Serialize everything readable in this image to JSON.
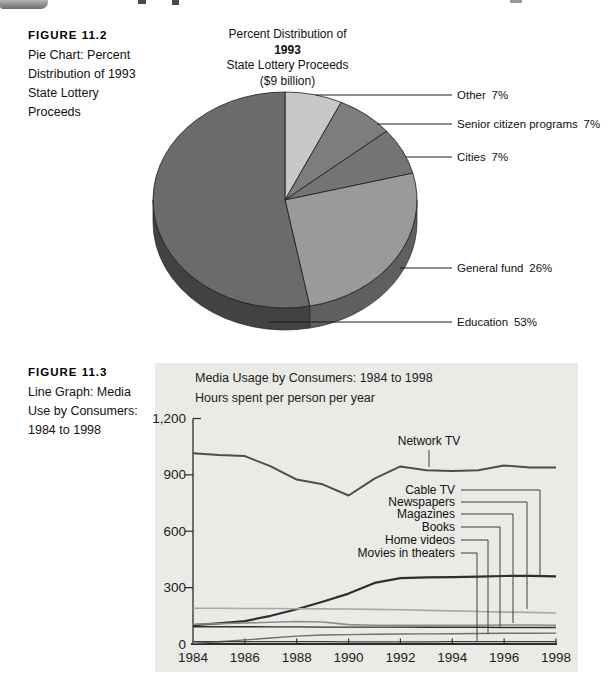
{
  "page": {
    "figure2": {
      "heading": "FIGURE 11.2",
      "caption_lines": [
        "Pie Chart: Percent",
        "Distribution of 1993",
        "State Lottery Proceeds"
      ]
    },
    "figure3": {
      "heading": "FIGURE 11.3",
      "caption_lines": [
        "Line Graph: Media",
        "Use by Consumers:",
        "1984 to 1998"
      ]
    }
  },
  "chart_data": [
    {
      "type": "pie",
      "title_lines": [
        "Percent Distribution of",
        "1993",
        "State Lottery Proceeds",
        "($9 billion)"
      ],
      "start_at": "12 o'clock",
      "direction": "clockwise",
      "style": "3d",
      "outline_color": "#1a1a1a",
      "slices": [
        {
          "label": "Other",
          "pct": 7,
          "color": "#c8c8c8"
        },
        {
          "label": "Senior citizen programs",
          "pct": 7,
          "color": "#7d7d7d"
        },
        {
          "label": "Cities",
          "pct": 7,
          "color": "#747474"
        },
        {
          "label": "General fund",
          "pct": 26,
          "color": "#9a9a9a"
        },
        {
          "label": "Education",
          "pct": 53,
          "color": "#6b6b6b"
        }
      ]
    },
    {
      "type": "line",
      "title": "Media Usage by Consumers: 1984 to 1998",
      "ylabel": "Hours spent per person per year",
      "xlabel": "",
      "ylim": [
        0,
        1200
      ],
      "grid": false,
      "legend_position": "inline-labels",
      "panel_color": "#eaeae7",
      "x": [
        1984,
        1985,
        1986,
        1987,
        1988,
        1989,
        1990,
        1991,
        1992,
        1993,
        1994,
        1995,
        1996,
        1997,
        1998
      ],
      "xticks": [
        1984,
        1986,
        1988,
        1990,
        1992,
        1994,
        1996,
        1998
      ],
      "ytick_values": [
        1200,
        900,
        600,
        300,
        0
      ],
      "ytick_labels": [
        "1,200",
        "900",
        "600",
        "300",
        "0"
      ],
      "series": [
        {
          "name": "Network TV",
          "color": "#4d4d4d",
          "width": 2.0,
          "values": [
            1015,
            1005,
            1000,
            945,
            875,
            850,
            790,
            880,
            945,
            925,
            920,
            925,
            950,
            940,
            940
          ]
        },
        {
          "name": "Cable TV",
          "color": "#2e2e2e",
          "width": 2.2,
          "values": [
            100,
            110,
            122,
            150,
            185,
            225,
            268,
            325,
            350,
            355,
            356,
            358,
            362,
            363,
            360
          ]
        },
        {
          "name": "Newspapers",
          "color": "#a9a9a9",
          "width": 1.6,
          "values": [
            190,
            190,
            189,
            189,
            188,
            187,
            186,
            184,
            182,
            179,
            176,
            173,
            170,
            168,
            165
          ]
        },
        {
          "name": "Magazines",
          "color": "#8d8d8d",
          "width": 1.6,
          "values": [
            105,
            108,
            112,
            116,
            120,
            117,
            103,
            100,
            99,
            99,
            100,
            100,
            101,
            101,
            100
          ]
        },
        {
          "name": "Books",
          "color": "#2f2f2f",
          "width": 1.4,
          "values": [
            92,
            92,
            92,
            91,
            91,
            90,
            90,
            90,
            90,
            89,
            89,
            89,
            88,
            88,
            88
          ]
        },
        {
          "name": "Home videos",
          "color": "#6f6f6f",
          "width": 1.4,
          "values": [
            3,
            12,
            22,
            32,
            42,
            48,
            50,
            52,
            53,
            54,
            55,
            56,
            57,
            57,
            58
          ]
        },
        {
          "name": "Movies in theaters",
          "color": "#3c3c3c",
          "width": 1.2,
          "values": [
            12,
            12,
            12,
            12,
            12,
            12,
            11,
            11,
            11,
            11,
            12,
            12,
            13,
            13,
            13
          ]
        }
      ]
    }
  ]
}
